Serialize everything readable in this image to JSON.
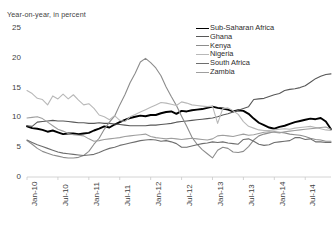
{
  "chart_data": {
    "type": "line",
    "title": "Year-on-year, in percent",
    "xlabel": "",
    "ylabel": "",
    "ylim": [
      0,
      25
    ],
    "yticks": [
      0,
      5,
      10,
      15,
      20,
      25
    ],
    "grid": false,
    "legend_position": "top-right",
    "x_tick_labels": [
      "Jan-10",
      "Jul-10",
      "Jan-11",
      "Jul-11",
      "Jan-12",
      "Jul-12",
      "Jan-13",
      "Jul-13",
      "Jan-14",
      "Jul-14"
    ],
    "x_tick_indices": [
      0,
      6,
      12,
      18,
      24,
      30,
      36,
      42,
      48,
      54
    ],
    "x": [
      "Jan-10",
      "Feb-10",
      "Mar-10",
      "Apr-10",
      "May-10",
      "Jun-10",
      "Jul-10",
      "Aug-10",
      "Sep-10",
      "Oct-10",
      "Nov-10",
      "Dec-10",
      "Jan-11",
      "Feb-11",
      "Mar-11",
      "Apr-11",
      "May-11",
      "Jun-11",
      "Jul-11",
      "Aug-11",
      "Sep-11",
      "Oct-11",
      "Nov-11",
      "Dec-11",
      "Jan-12",
      "Feb-12",
      "Mar-12",
      "Apr-12",
      "May-12",
      "Jun-12",
      "Jul-12",
      "Aug-12",
      "Sep-12",
      "Oct-12",
      "Nov-12",
      "Dec-12",
      "Jan-13",
      "Feb-13",
      "Mar-13",
      "Apr-13",
      "May-13",
      "Jun-13",
      "Jul-13",
      "Aug-13",
      "Sep-13",
      "Oct-13",
      "Nov-13",
      "Dec-13",
      "Jan-14",
      "Feb-14",
      "Mar-14",
      "Apr-14",
      "May-14",
      "Jun-14",
      "Jul-14",
      "Aug-14",
      "Sep-14",
      "Oct-14",
      "Nov-14",
      "Dec-14"
    ],
    "series": [
      {
        "name": "Sub-Saharan Africa",
        "color": "#000000",
        "width": 1.9,
        "values": [
          8.5,
          8.2,
          8.1,
          7.9,
          7.6,
          7.8,
          7.5,
          7.2,
          7.3,
          7.3,
          7.2,
          7.3,
          7.4,
          7.8,
          8.1,
          8.5,
          8.3,
          8.8,
          9.2,
          9.6,
          9.9,
          10.1,
          10.3,
          10.2,
          10.4,
          10.4,
          10.7,
          10.9,
          11.0,
          10.6,
          11.1,
          11.0,
          11.2,
          11.3,
          11.4,
          11.6,
          11.8,
          11.6,
          11.5,
          11.3,
          11.0,
          11.2,
          11.1,
          10.6,
          9.8,
          9.1,
          8.7,
          8.3,
          8.1,
          8.4,
          8.6,
          8.9,
          9.2,
          9.4,
          9.6,
          9.8,
          9.7,
          9.9,
          9.3,
          8.0
        ]
      },
      {
        "name": "Ghana",
        "color": "#585858",
        "width": 1.1,
        "values": [
          8.6,
          8.5,
          9.2,
          9.3,
          9.4,
          9.5,
          9.4,
          9.4,
          9.3,
          9.2,
          9.1,
          9.1,
          9.0,
          9.0,
          9.1,
          9.0,
          9.0,
          8.9,
          8.8,
          8.7,
          8.6,
          8.6,
          8.6,
          8.6,
          8.7,
          8.7,
          8.8,
          8.9,
          9.0,
          9.2,
          9.3,
          9.4,
          9.5,
          9.6,
          9.7,
          9.8,
          9.9,
          10.1,
          10.4,
          10.6,
          10.9,
          11.2,
          11.5,
          11.8,
          13.0,
          13.1,
          13.2,
          13.5,
          13.8,
          14.0,
          14.5,
          14.7,
          14.8,
          15.0,
          15.3,
          15.9,
          16.5,
          16.9,
          17.2,
          17.3
        ]
      },
      {
        "name": "Kenya",
        "color": "#8c8c8c",
        "width": 1.1,
        "values": [
          6.1,
          5.5,
          4.8,
          4.3,
          4.0,
          3.7,
          3.5,
          3.3,
          3.2,
          3.2,
          3.3,
          3.6,
          4.3,
          5.5,
          6.5,
          8.0,
          9.2,
          10.2,
          12.1,
          13.8,
          15.8,
          17.4,
          19.3,
          19.9,
          19.2,
          18.3,
          17.0,
          15.1,
          13.5,
          12.0,
          10.2,
          8.5,
          6.7,
          5.5,
          4.6,
          3.9,
          3.2,
          4.5,
          5.0,
          4.8,
          4.2,
          4.1,
          4.3,
          5.1,
          6.2,
          6.9,
          7.2,
          7.4,
          7.6,
          7.5,
          7.4,
          7.2,
          7.1,
          7.0,
          6.8,
          6.5,
          6.3,
          6.2,
          6.0,
          6.0
        ]
      },
      {
        "name": "Nigeria",
        "color": "#b8b8b8",
        "width": 1.1,
        "values": [
          14.5,
          14.0,
          13.2,
          13.0,
          12.1,
          13.6,
          13.1,
          13.9,
          13.1,
          13.8,
          12.9,
          12.1,
          12.3,
          11.5,
          10.4,
          10.1,
          9.6,
          10.3,
          9.5,
          9.3,
          10.1,
          10.5,
          10.9,
          11.3,
          11.7,
          12.1,
          12.5,
          12.4,
          12.2,
          12.0,
          12.6,
          12.4,
          12.1,
          12.0,
          11.9,
          11.8,
          11.9,
          9.0,
          11.5,
          11.6,
          11.1,
          10.5,
          9.3,
          8.5,
          8.2,
          7.9,
          7.8,
          7.8,
          7.9,
          8.0,
          8.1,
          8.0,
          8.2,
          8.3,
          8.4,
          8.5,
          8.3,
          8.1,
          7.9,
          7.8
        ]
      },
      {
        "name": "South Africa",
        "color": "#6e6e6e",
        "width": 1.1,
        "values": [
          6.2,
          5.8,
          5.4,
          5.1,
          4.8,
          4.5,
          4.2,
          4.0,
          3.9,
          3.8,
          3.7,
          3.6,
          3.7,
          3.8,
          4.1,
          4.5,
          4.8,
          5.0,
          5.3,
          5.5,
          5.7,
          5.9,
          6.1,
          6.2,
          6.3,
          6.2,
          6.0,
          6.1,
          5.9,
          5.6,
          5.0,
          5.0,
          5.2,
          5.4,
          5.6,
          5.7,
          5.9,
          5.8,
          5.9,
          5.7,
          5.6,
          5.5,
          6.3,
          6.4,
          6.0,
          5.5,
          5.3,
          5.4,
          5.8,
          5.9,
          6.0,
          6.1,
          6.6,
          6.6,
          6.3,
          6.4,
          5.9,
          5.9,
          5.8,
          5.8
        ]
      },
      {
        "name": "Zambia",
        "color": "#9e9e9e",
        "width": 1.1,
        "values": [
          9.9,
          10.0,
          10.1,
          9.8,
          9.2,
          8.6,
          8.0,
          7.7,
          7.3,
          7.1,
          7.0,
          6.9,
          6.4,
          6.0,
          6.1,
          6.3,
          6.4,
          6.5,
          6.6,
          6.8,
          6.9,
          7.0,
          7.1,
          7.2,
          6.8,
          6.6,
          6.5,
          6.4,
          6.5,
          6.4,
          6.3,
          6.4,
          6.5,
          6.4,
          6.3,
          6.2,
          6.4,
          6.9,
          7.0,
          6.9,
          6.8,
          7.0,
          7.2,
          7.0,
          7.1,
          7.3,
          7.5,
          7.6,
          7.5,
          7.4,
          7.6,
          7.7,
          7.8,
          7.9,
          8.0,
          8.1,
          8.2,
          8.3,
          8.4,
          8.0
        ]
      }
    ]
  }
}
